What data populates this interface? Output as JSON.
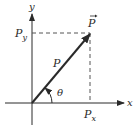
{
  "diagram": {
    "type": "vector-components",
    "labels": {
      "y_axis": "y",
      "x_axis": "x",
      "vector_name": "P",
      "vector_symbol": "P",
      "magnitude": "P",
      "angle": "θ",
      "x_component": "P",
      "x_component_sub": "x",
      "y_component": "P",
      "y_component_sub": "y"
    },
    "colors": {
      "line": "#2a2a2a",
      "dashed": "#555555"
    }
  }
}
